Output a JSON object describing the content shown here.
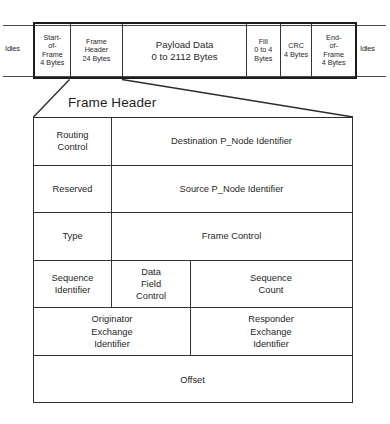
{
  "diagram": {
    "title": "Frame Header",
    "idle_left_label": "Idles",
    "idle_right_label": "Idles",
    "frame_strip": [
      {
        "name": "start-of-frame",
        "lines": [
          "Start-",
          "of-",
          "Frame",
          "4 Bytes"
        ]
      },
      {
        "name": "frame-header",
        "lines": [
          "Frame",
          "Header",
          "24 Bytes"
        ]
      },
      {
        "name": "payload-data",
        "lines": [
          "Payload Data",
          "0 to 2112 Bytes"
        ]
      },
      {
        "name": "fill",
        "lines": [
          "Fill",
          "0 to 4",
          "Bytes"
        ]
      },
      {
        "name": "crc",
        "lines": [
          "CRC",
          "4 Bytes"
        ]
      },
      {
        "name": "end-of-frame",
        "lines": [
          "End-",
          "of-",
          "Frame",
          "4 Bytes"
        ]
      }
    ],
    "header_rows": [
      {
        "cells": [
          {
            "name": "routing-control",
            "lines": [
              "Routing",
              "Control"
            ]
          },
          {
            "name": "destination-p-node-identifier",
            "lines": [
              "Destination P_Node Identifier"
            ]
          }
        ]
      },
      {
        "cells": [
          {
            "name": "reserved",
            "lines": [
              "Reserved"
            ]
          },
          {
            "name": "source-p-node-identifier",
            "lines": [
              "Source P_Node Identifier"
            ]
          }
        ]
      },
      {
        "cells": [
          {
            "name": "type",
            "lines": [
              "Type"
            ]
          },
          {
            "name": "frame-control",
            "lines": [
              "Frame Control"
            ]
          }
        ]
      },
      {
        "cells": [
          {
            "name": "sequence-identifier",
            "lines": [
              "Sequence",
              "Identifier"
            ]
          },
          {
            "name": "data-field-control",
            "lines": [
              "Data",
              "Field",
              "Control"
            ]
          },
          {
            "name": "sequence-count",
            "lines": [
              "Sequence",
              "Count"
            ]
          }
        ]
      },
      {
        "cells": [
          {
            "name": "originator-exchange-identifier",
            "lines": [
              "Originator",
              "Exchange",
              "Identifier"
            ]
          },
          {
            "name": "responder-exchange-identifier",
            "lines": [
              "Responder",
              "Exchange",
              "Identifier"
            ]
          }
        ]
      },
      {
        "cells": [
          {
            "name": "offset",
            "lines": [
              "Offset"
            ]
          }
        ]
      }
    ],
    "colors": {
      "line": "#2d2d2d",
      "bold_line": "#1c1c1c",
      "text": "#1f1f1f",
      "background": "#ffffff"
    }
  }
}
